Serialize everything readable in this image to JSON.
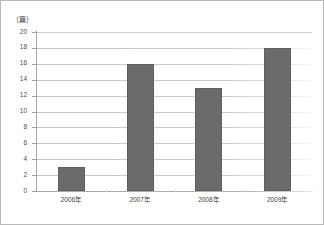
{
  "chart_data": {
    "type": "bar",
    "title": "",
    "subtitle": "",
    "xlabel": "",
    "ylabel": "",
    "unit_label": "（篇）",
    "categories": [
      "2006年",
      "2007年",
      "2008年",
      "2009年"
    ],
    "values": [
      3,
      16,
      13,
      18
    ],
    "series": [
      {
        "name": "",
        "values": [
          3,
          16,
          13,
          18
        ]
      }
    ],
    "ylim": [
      0,
      20
    ],
    "ytick_step": 2,
    "yticks": [
      20,
      18,
      16,
      14,
      12,
      10,
      8,
      6,
      4,
      2,
      0
    ],
    "ytick_labels": [
      "20",
      "18",
      "16",
      "14",
      "12",
      "10",
      "8",
      "6",
      "4",
      "2",
      "0"
    ],
    "grid": true,
    "grid_axis": "y",
    "legend": false,
    "legend_position": "none",
    "orientation": "vertical",
    "annotations": [],
    "colors": {
      "bar_fill": "#6b6b6b",
      "bar_edge": "#5e5e5e",
      "gridline": "#cfcfcf",
      "axis": "#a8a8a8",
      "tick_text": "#4a4a4a",
      "category_text": "#3f3f3f",
      "background": "#ffffff",
      "frame_border": "#b9b9b9"
    }
  }
}
